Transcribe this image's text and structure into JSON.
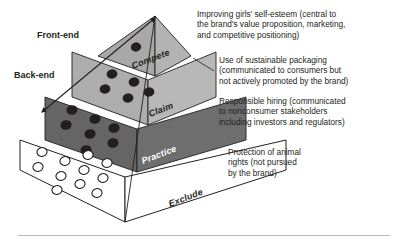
{
  "figure": {
    "axis": {
      "arrow_name": "front-end-back-end-arrow",
      "top_label": "Front-end",
      "bottom_label": "Back-end"
    },
    "tiers": [
      {
        "id": "compete",
        "label": "Compete",
        "fill": "#b3b3b3",
        "left_face_fill": "#a8a8a8",
        "marker_style": "filled",
        "marker_count": 1,
        "annotation": "Improving girls' self-esteem (central to\nthe brand's value proposition, marketing,\nand competitive positioning)"
      },
      {
        "id": "claim",
        "label": "Claim",
        "fill": "#b8b8b8",
        "left_face_fill": "#adadad",
        "marker_style": "filled",
        "marker_count": 5,
        "annotation": "Use of sustainable packaging\n(communicated to consumers but\nnot actively promoted by the brand)"
      },
      {
        "id": "practice",
        "label": "Practice",
        "fill": "#6e6e6e",
        "left_face_fill": "#656565",
        "marker_style": "filled",
        "marker_count": 7,
        "annotation": "Responsible hiring (communicated\nto nonconsumer stakeholders\nincluding investors and regulators)"
      },
      {
        "id": "exclude",
        "label": "Exclude",
        "fill": "#ffffff",
        "left_face_fill": "#ffffff",
        "marker_style": "hollow",
        "marker_count": 11,
        "annotation": "Protection of animal\nrights (not pursued\nby the brand)"
      }
    ],
    "colors": {
      "outline": "#231f20",
      "text": "#231f20",
      "tier_label_light": "#ffffff",
      "background": "#ffffff",
      "rule": "#b9b9b9"
    }
  }
}
